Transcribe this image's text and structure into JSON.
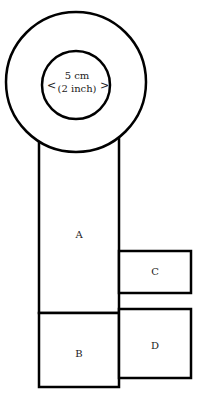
{
  "diagram": {
    "circle_label_line1": "5 cm",
    "circle_label_line2": "(2 inch)",
    "arrow_left": "<",
    "arrow_right": ">",
    "panels": {
      "a": "A",
      "b": "B",
      "c": "C",
      "d": "D"
    },
    "colors": {
      "stroke": "#000000",
      "fill": "#ffffff"
    }
  }
}
